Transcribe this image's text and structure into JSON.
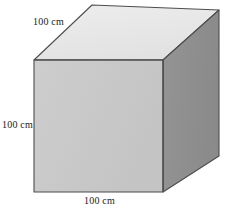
{
  "figure": {
    "name": "cube-diagram",
    "shape": "cube",
    "background_color": "#ffffff",
    "edge_color": "#4d4d4d",
    "faces": {
      "front": {
        "name": "front-face",
        "color": "#c9c9c9",
        "points": "34,60 163,60 163,192 34,192"
      },
      "top": {
        "name": "top-face",
        "color": "#e8e8e8",
        "points": "34,60 92,5 219,10 163,60"
      },
      "right": {
        "name": "right-face",
        "color": "#8e8e8e",
        "points": "163,60 219,10 219,156 163,192"
      }
    },
    "labels": {
      "top": "100 cm",
      "left": "100 cm",
      "bottom": "100 cm"
    }
  }
}
